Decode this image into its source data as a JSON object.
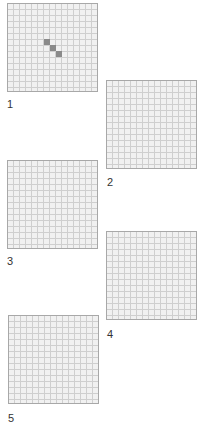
{
  "panels": [
    {
      "label": "1",
      "grid_cols": 15,
      "grid_rows": 15,
      "shaded_cells": [
        [
          6,
          6
        ],
        [
          7,
          7
        ],
        [
          8,
          8
        ]
      ]
    },
    {
      "label": "2",
      "grid_cols": 15,
      "grid_rows": 15,
      "shaded_cells": []
    },
    {
      "label": "3",
      "grid_cols": 15,
      "grid_rows": 15,
      "shaded_cells": []
    },
    {
      "label": "4",
      "grid_cols": 15,
      "grid_rows": 15,
      "shaded_cells": []
    },
    {
      "label": "5",
      "grid_cols": 15,
      "grid_rows": 15,
      "shaded_cells": []
    }
  ],
  "colors": {
    "grid_line": "#cfcfcf",
    "grid_background": "#f1f1f1",
    "border": "#a8a8a8",
    "shaded_cell": "#8a8a8a",
    "label": "#333333"
  }
}
